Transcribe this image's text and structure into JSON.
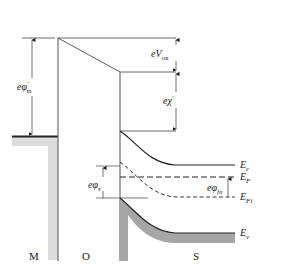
{
  "diagram": {
    "regions": {
      "metal": "M",
      "oxide": "O",
      "semiconductor": "S"
    },
    "labels": {
      "metal_work_function": {
        "main": "eφ",
        "sub": "m",
        "prime": "′"
      },
      "oxide_voltage": {
        "main": "eV",
        "sub": "ox"
      },
      "electron_affinity": {
        "main": "eχ",
        "prime": "′"
      },
      "surface_potential": {
        "main": "eφ",
        "sub": "s"
      },
      "fermi_potential": {
        "main": "eφ",
        "sub": "fn"
      }
    },
    "band_labels": {
      "conduction": {
        "main": "E",
        "sub": "c"
      },
      "fermi": {
        "main": "E",
        "sub": "F"
      },
      "intrinsic": {
        "main": "E",
        "sub": "Fi"
      },
      "valence": {
        "main": "E",
        "sub": "v"
      }
    },
    "colors": {
      "line": "#222222",
      "metal_fill": "#dcdcdc",
      "valence_fill": "#a6a6a6"
    }
  }
}
